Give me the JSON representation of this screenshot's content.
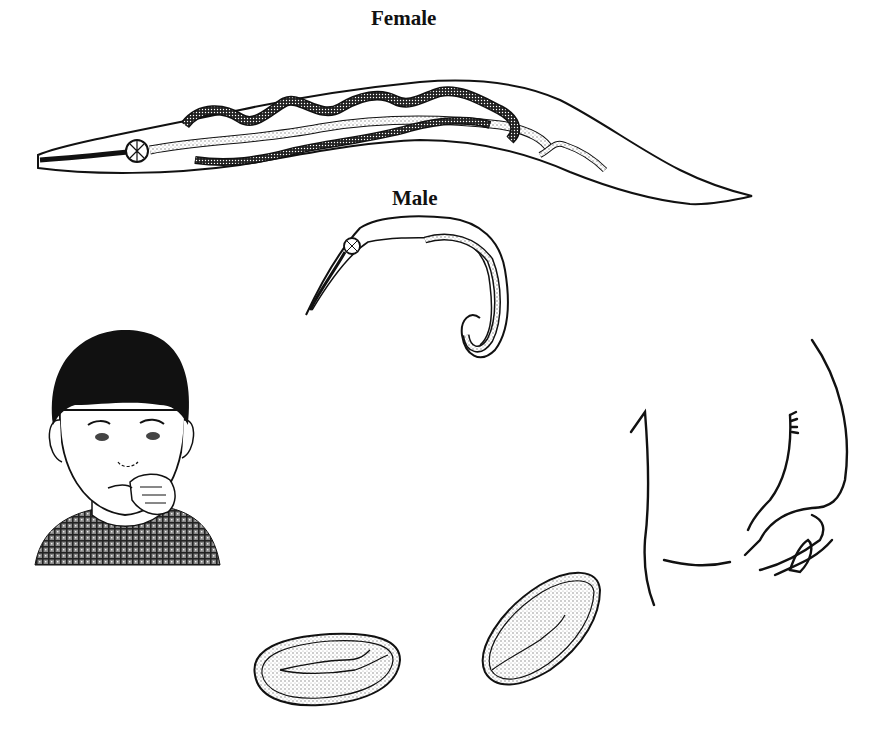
{
  "figure": {
    "labels": {
      "female": "Female",
      "male": "Male"
    },
    "panels": [
      {
        "id": "female-worm",
        "description": "Adult female worm, elongated with coiled internal organs and a long pointed tail"
      },
      {
        "id": "male-worm",
        "description": "Adult male worm with a curled posterior end"
      },
      {
        "id": "child",
        "description": "Child with fingers in mouth"
      },
      {
        "id": "perianal-region",
        "description": "Outline sketch of buttocks / perianal region"
      },
      {
        "id": "eggs",
        "description": "Two oval eggs containing larvae"
      }
    ],
    "colors": {
      "ink": "#111111",
      "background": "#ffffff",
      "stipple": "#9a9a9a"
    }
  }
}
